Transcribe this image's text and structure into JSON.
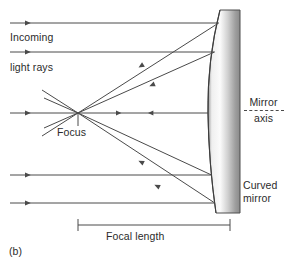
{
  "figure": {
    "panel_label": "(b)"
  },
  "labels": {
    "incoming_line1": "Incoming",
    "incoming_line2": "light rays",
    "focus": "Focus",
    "axis_line1": "Mirror",
    "axis_line2": "axis",
    "mirror_line1": "Curved",
    "mirror_line2": "mirror",
    "focal_length": "Focal length"
  },
  "colors": {
    "ray": "#4a4a4a",
    "outline": "#3a3a3a",
    "text": "#2b2b2b",
    "mirror_light": "#f2f2f2",
    "mirror_mid": "#d9d9d9",
    "mirror_dark": "#8f8f8f",
    "background": "#ffffff"
  },
  "geometry": {
    "width": 288,
    "height": 267,
    "focus_x": 78,
    "focus_y": 113,
    "mirror_vertex_x": 208,
    "mirror_top_y": 10,
    "mirror_bottom_y": 213,
    "mirror_back_x": 240,
    "incoming_ray_y": [
      23,
      52,
      113,
      175,
      203
    ],
    "focal_bar_y": 225,
    "focal_bar_x1": 78,
    "focal_bar_x2": 230
  }
}
